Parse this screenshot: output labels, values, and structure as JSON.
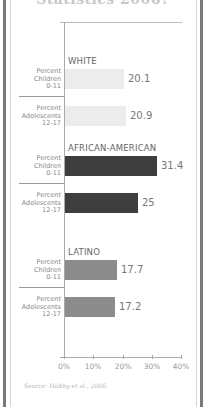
{
  "title": "Statistics 2006?",
  "chart_data": {
    "type": "bar",
    "orientation": "horizontal",
    "title": "",
    "xlabel": "",
    "ylabel": "",
    "xlim": [
      0,
      40
    ],
    "x_ticks": [
      "0%",
      "10%",
      "20%",
      "30%",
      "40%"
    ],
    "grid": false,
    "groups": [
      {
        "name": "WHITE",
        "color": "#ececec",
        "rows": [
          {
            "label": [
              "Percent",
              "Children",
              "0-11"
            ],
            "value": 20.1,
            "display": "20.1"
          },
          {
            "label": [
              "Percent",
              "Adolescents",
              "12-17"
            ],
            "value": 20.9,
            "display": "20.9"
          }
        ]
      },
      {
        "name": "AFRICAN-AMERICAN",
        "color": "#3e3e3e",
        "rows": [
          {
            "label": [
              "Percent",
              "Children",
              "0-11"
            ],
            "value": 31.4,
            "display": "31.4"
          },
          {
            "label": [
              "Percent",
              "Adolescents",
              "12-17"
            ],
            "value": 25,
            "display": "25"
          }
        ]
      },
      {
        "name": "LATINO",
        "color": "#8c8c8c",
        "rows": [
          {
            "label": [
              "Percent",
              "Children",
              "0-11"
            ],
            "value": 17.7,
            "display": "17.7"
          },
          {
            "label": [
              "Percent",
              "Adolescents",
              "12-17"
            ],
            "value": 17.2,
            "display": "17.2"
          }
        ]
      }
    ],
    "categories": [
      "White Children 0-11",
      "White Adolescents 12-17",
      "African-American Children 0-11",
      "African-American Adolescents 12-17",
      "Latino Children 0-11",
      "Latino Adolescents 12-17"
    ],
    "values": [
      20.1,
      20.9,
      31.4,
      25,
      17.7,
      17.2
    ]
  },
  "source": "Source: Holtby et al., 2006."
}
